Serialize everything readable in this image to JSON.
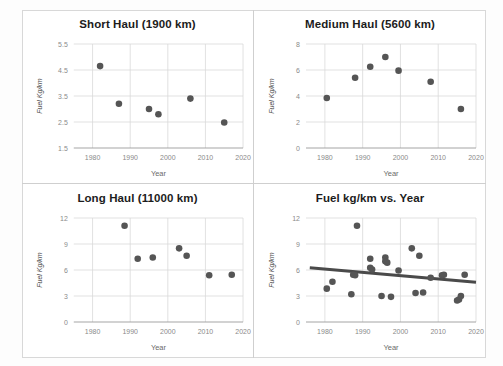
{
  "figure": {
    "layout": "2x2-grid-of-scatter-panels",
    "background_color": "#ffffff",
    "dot_color": "#555555",
    "gridline_color": "#d9d9d9",
    "trendline_color": "#4a4a4a"
  },
  "chart_data": [
    {
      "type": "scatter",
      "title": "Short Haul (1900 km)",
      "xlabel": "Year",
      "ylabel": "Fuel Kg/km",
      "xlim": [
        1975,
        2020
      ],
      "ylim": [
        1.5,
        5.5
      ],
      "xticks": [
        1980,
        1990,
        2000,
        2010,
        2020
      ],
      "yticks": [
        1.5,
        2.5,
        3.5,
        4.5,
        5.5
      ],
      "grid": true,
      "legend": "none",
      "points": [
        {
          "x": 1982,
          "y": 4.65
        },
        {
          "x": 1987,
          "y": 3.2
        },
        {
          "x": 1995,
          "y": 3.0
        },
        {
          "x": 1997.5,
          "y": 2.8
        },
        {
          "x": 2006,
          "y": 3.4
        },
        {
          "x": 2015,
          "y": 2.48
        }
      ]
    },
    {
      "type": "scatter",
      "title": "Medium Haul (5600 km)",
      "xlabel": "Year",
      "ylabel": "Fuel Kg/km",
      "xlim": [
        1975,
        2020
      ],
      "ylim": [
        0,
        8
      ],
      "xticks": [
        1980,
        1990,
        2000,
        2010,
        2020
      ],
      "yticks": [
        0,
        2,
        4,
        6,
        8
      ],
      "grid": true,
      "legend": "none",
      "points": [
        {
          "x": 1980.5,
          "y": 3.85
        },
        {
          "x": 1988,
          "y": 5.4
        },
        {
          "x": 1992,
          "y": 6.25
        },
        {
          "x": 1996,
          "y": 7.0
        },
        {
          "x": 1999.5,
          "y": 5.95
        },
        {
          "x": 2008,
          "y": 5.1
        },
        {
          "x": 2016,
          "y": 3.0
        }
      ]
    },
    {
      "type": "scatter",
      "title": "Long Haul (11000 km)",
      "xlabel": "Year",
      "ylabel": "Fuel Kg/km",
      "xlim": [
        1975,
        2020
      ],
      "ylim": [
        0,
        12
      ],
      "xticks": [
        1980,
        1990,
        2000,
        2010,
        2020
      ],
      "yticks": [
        0,
        3,
        6,
        9,
        12
      ],
      "grid": true,
      "legend": "none",
      "points": [
        {
          "x": 1988.5,
          "y": 11.1
        },
        {
          "x": 1992,
          "y": 7.3
        },
        {
          "x": 1996,
          "y": 7.45
        },
        {
          "x": 2003,
          "y": 8.5
        },
        {
          "x": 2005,
          "y": 7.65
        },
        {
          "x": 2011,
          "y": 5.4
        },
        {
          "x": 2017,
          "y": 5.45
        }
      ]
    },
    {
      "type": "scatter",
      "title": "Fuel kg/km vs. Year",
      "xlabel": "Year",
      "ylabel": "Fuel Kg/km",
      "xlim": [
        1975,
        2020
      ],
      "ylim": [
        0,
        12
      ],
      "xticks": [
        1980,
        1990,
        2000,
        2010,
        2020
      ],
      "yticks": [
        0,
        3,
        6,
        9,
        12
      ],
      "grid": true,
      "legend": "none",
      "has_trendline": true,
      "trendline": {
        "x1": 1976,
        "y1": 6.25,
        "x2": 2020,
        "y2": 4.6
      },
      "points": [
        {
          "x": 1980.5,
          "y": 3.85
        },
        {
          "x": 1982,
          "y": 4.65
        },
        {
          "x": 1987,
          "y": 3.2
        },
        {
          "x": 1987.5,
          "y": 5.45
        },
        {
          "x": 1988,
          "y": 5.4
        },
        {
          "x": 1988.5,
          "y": 11.1
        },
        {
          "x": 1992,
          "y": 7.3
        },
        {
          "x": 1992,
          "y": 6.25
        },
        {
          "x": 1992.5,
          "y": 6.05
        },
        {
          "x": 1995,
          "y": 3.0
        },
        {
          "x": 1996,
          "y": 7.45
        },
        {
          "x": 1996,
          "y": 7.0
        },
        {
          "x": 1996.5,
          "y": 6.85
        },
        {
          "x": 1997.5,
          "y": 2.9
        },
        {
          "x": 1999.5,
          "y": 5.95
        },
        {
          "x": 2003,
          "y": 8.5
        },
        {
          "x": 2004,
          "y": 3.35
        },
        {
          "x": 2005,
          "y": 7.65
        },
        {
          "x": 2006,
          "y": 3.4
        },
        {
          "x": 2008,
          "y": 5.1
        },
        {
          "x": 2011,
          "y": 5.4
        },
        {
          "x": 2011.5,
          "y": 5.45
        },
        {
          "x": 2015,
          "y": 2.48
        },
        {
          "x": 2015.5,
          "y": 2.6
        },
        {
          "x": 2016,
          "y": 3.0
        },
        {
          "x": 2017,
          "y": 5.45
        }
      ]
    }
  ]
}
